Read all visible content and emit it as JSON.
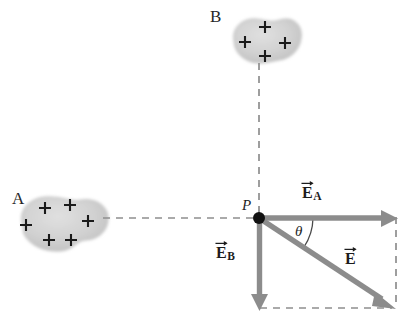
{
  "figure": {
    "type": "physics-vector-diagram",
    "width": 411,
    "height": 325,
    "background_color": "#ffffff"
  },
  "colors": {
    "vector_gray": "#8c8c8c",
    "vector_gray_dark": "#7b7b7b",
    "dashed_gray": "#8e8e8e",
    "blob_fill": "#d2d2d2",
    "blob_edge": "#b9b9b9",
    "text_black": "#1c1c1c",
    "point_dot": "#121212"
  },
  "objects": [
    {
      "name": "object-a",
      "label": "A",
      "label_x": 12,
      "label_y": 190,
      "charge_sign": "+",
      "charge_count": 6,
      "center_x": 63,
      "center_y": 224,
      "radius_x": 45,
      "radius_y": 28,
      "charges": [
        {
          "x": 45,
          "y": 208
        },
        {
          "x": 70,
          "y": 205
        },
        {
          "x": 26,
          "y": 225
        },
        {
          "x": 88,
          "y": 221
        },
        {
          "x": 49,
          "y": 240
        },
        {
          "x": 71,
          "y": 240
        }
      ]
    },
    {
      "name": "object-b",
      "label": "B",
      "label_x": 210,
      "label_y": 8,
      "charge_sign": "+",
      "charge_count": 4,
      "center_x": 266,
      "center_y": 40,
      "radius_x": 34,
      "radius_y": 24,
      "charges": [
        {
          "x": 265,
          "y": 27
        },
        {
          "x": 245,
          "y": 42
        },
        {
          "x": 285,
          "y": 43
        },
        {
          "x": 265,
          "y": 56
        }
      ]
    }
  ],
  "point": {
    "name": "point-p",
    "label": "P",
    "label_x": 243,
    "label_y": 200,
    "x": 259,
    "y": 218,
    "dot_radius": 5
  },
  "vectors": [
    {
      "name": "vector-e-a",
      "label_base": "E",
      "label_sub": "A",
      "direction": "right",
      "x1": 259,
      "y1": 218,
      "x2": 396,
      "y2": 218,
      "label_x": 304,
      "label_y": 186
    },
    {
      "name": "vector-e-b",
      "label_base": "E",
      "label_sub": "B",
      "direction": "down",
      "x1": 259,
      "y1": 218,
      "x2": 259,
      "y2": 308,
      "label_x": 216,
      "label_y": 246
    },
    {
      "name": "vector-e-resultant",
      "label_base": "E",
      "label_sub": "",
      "direction": "down-right",
      "x1": 259,
      "y1": 218,
      "x2": 394,
      "y2": 307,
      "label_x": 345,
      "label_y": 252
    }
  ],
  "angle": {
    "name": "angle-theta",
    "label": "θ",
    "label_x": 296,
    "label_y": 226,
    "vertex_x": 259,
    "vertex_y": 218,
    "radius": 52,
    "start_deg": 0,
    "end_deg": 33
  },
  "dashed_lines": [
    {
      "name": "dashed-line-a-to-p",
      "x1": 103,
      "y1": 218,
      "x2": 256,
      "y2": 218
    },
    {
      "name": "dashed-line-b-to-p",
      "x1": 259,
      "y1": 63,
      "x2": 259,
      "y2": 214
    },
    {
      "name": "dashed-line-bottom",
      "x1": 259,
      "y1": 308,
      "x2": 392,
      "y2": 308
    },
    {
      "name": "dashed-line-right",
      "x1": 396,
      "y1": 216,
      "x2": 396,
      "y2": 308
    }
  ]
}
